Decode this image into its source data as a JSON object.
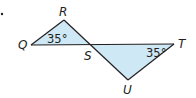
{
  "figure": {
    "marker": "•",
    "fill_color": "#cfe8f5",
    "stroke_color": "#231f20",
    "vertices": {
      "Q": {
        "label": "Q",
        "x": 31,
        "y": 45
      },
      "R": {
        "label": "R",
        "x": 64,
        "y": 20
      },
      "S": {
        "label": "S",
        "x": 91,
        "y": 45
      },
      "T": {
        "label": "T",
        "x": 174,
        "y": 44
      },
      "U": {
        "label": "U",
        "x": 128,
        "y": 80
      }
    },
    "triangles": [
      {
        "name": "QRS",
        "vertices": [
          "Q",
          "R",
          "S"
        ]
      },
      {
        "name": "STU",
        "vertices": [
          "S",
          "T",
          "U"
        ]
      }
    ],
    "angles": [
      {
        "at": "Q",
        "label": "35°"
      },
      {
        "at": "T",
        "label": "35°"
      }
    ]
  }
}
